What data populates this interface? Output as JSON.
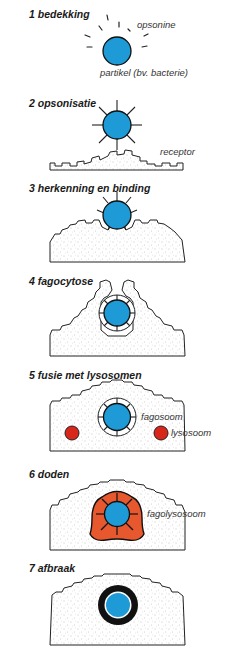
{
  "diagram": {
    "colors": {
      "particle": "#1e9ad6",
      "lysosome": "#d8261a",
      "fagolysosome": "#e8582e",
      "outline": "#111111",
      "cell_stipple": "#9a9a9a"
    },
    "steps": [
      {
        "number": "1",
        "title": "1 bedekking",
        "labels": {
          "opsonine": "opsonine",
          "particle": "partikel (bv. bacterie)"
        }
      },
      {
        "number": "2",
        "title": "2 opsonisatie",
        "labels": {
          "receptor": "receptor"
        }
      },
      {
        "number": "3",
        "title": "3 herkenning en binding",
        "labels": {}
      },
      {
        "number": "4",
        "title": "4 fagocytose",
        "labels": {}
      },
      {
        "number": "5",
        "title": "5 fusie met lysosomen",
        "labels": {
          "fagosoom": "fagosoom",
          "lysosoom": "lysosoom"
        }
      },
      {
        "number": "6",
        "title": "6 doden",
        "labels": {
          "fagolysosoom": "fagolysosoom"
        }
      },
      {
        "number": "7",
        "title": "7 afbraak",
        "labels": {}
      }
    ]
  }
}
